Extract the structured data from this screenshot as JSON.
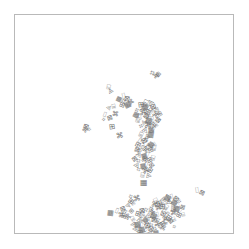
{
  "figure": {
    "background_color": "#ffffff",
    "frame_color": "#b9b9b9",
    "marker_color": "#737373",
    "frame": {
      "x": 14,
      "y": 14,
      "width": 220,
      "height": 220
    }
  },
  "chart_data": {
    "type": "scatter",
    "title": "",
    "subtitle": "",
    "xlabel": "",
    "ylabel": "",
    "xlim": [
      0,
      220
    ],
    "ylim": [
      0,
      220
    ],
    "grid": false,
    "legend": null,
    "axis_ticks": {
      "x": [],
      "y": []
    },
    "marker_style": "text-glyph",
    "clusters": [
      {
        "name": "upper-left-sparse",
        "approx_center_px": [
          110,
          100
        ],
        "count": 14
      },
      {
        "name": "upper-middle-chain",
        "approx_center_px": [
          140,
          120
        ],
        "count": 48
      },
      {
        "name": "mid-descending-tail",
        "approx_center_px": [
          136,
          150
        ],
        "count": 22
      },
      {
        "name": "lower-main-blob",
        "approx_center_px": [
          138,
          205
        ],
        "count": 72
      },
      {
        "name": "lower-right-arc",
        "approx_center_px": [
          158,
          196
        ],
        "count": 30
      },
      {
        "name": "outliers",
        "approx_center_px": [
          0,
          0
        ],
        "count": 6
      }
    ],
    "points": [
      [
        139,
        58,
        4.4,
        16
      ],
      [
        141,
        61,
        3.3,
        -22
      ],
      [
        144,
        59,
        3.0,
        40
      ],
      [
        95,
        72,
        3.6,
        12
      ],
      [
        96,
        76,
        3.1,
        -30
      ],
      [
        104,
        84,
        3.2,
        25
      ],
      [
        110,
        81,
        4.0,
        -14
      ],
      [
        113,
        84,
        3.6,
        8
      ],
      [
        110,
        86,
        4.2,
        34
      ],
      [
        116,
        87,
        3.2,
        -40
      ],
      [
        107,
        90,
        3.4,
        18
      ],
      [
        100,
        92,
        3.4,
        -10
      ],
      [
        95,
        92,
        3.0,
        44
      ],
      [
        113,
        90,
        3.8,
        -26
      ],
      [
        92,
        100,
        3.6,
        20
      ],
      [
        95,
        103,
        3.4,
        -18
      ],
      [
        90,
        104,
        3.0,
        36
      ],
      [
        100,
        99,
        3.4,
        6
      ],
      [
        127,
        90,
        3.8,
        -8
      ],
      [
        132,
        88,
        4.2,
        28
      ],
      [
        136,
        88,
        3.6,
        -34
      ],
      [
        130,
        92,
        4.0,
        14
      ],
      [
        135,
        93,
        3.4,
        42
      ],
      [
        139,
        92,
        3.8,
        -20
      ],
      [
        124,
        95,
        3.6,
        30
      ],
      [
        128,
        97,
        4.2,
        -12
      ],
      [
        133,
        97,
        3.4,
        22
      ],
      [
        138,
        96,
        3.8,
        -38
      ],
      [
        142,
        95,
        3.2,
        10
      ],
      [
        122,
        100,
        3.6,
        26
      ],
      [
        126,
        102,
        4.0,
        -16
      ],
      [
        131,
        101,
        3.4,
        38
      ],
      [
        136,
        101,
        3.8,
        -6
      ],
      [
        141,
        100,
        3.6,
        32
      ],
      [
        145,
        99,
        3.2,
        -28
      ],
      [
        124,
        106,
        3.8,
        12
      ],
      [
        129,
        107,
        3.4,
        -42
      ],
      [
        134,
        106,
        4.0,
        20
      ],
      [
        139,
        105,
        3.6,
        -14
      ],
      [
        143,
        105,
        3.4,
        36
      ],
      [
        128,
        111,
        3.6,
        -24
      ],
      [
        133,
        111,
        4.0,
        8
      ],
      [
        138,
        110,
        3.4,
        40
      ],
      [
        142,
        110,
        3.6,
        -32
      ],
      [
        131,
        115,
        3.8,
        18
      ],
      [
        136,
        115,
        3.4,
        -10
      ],
      [
        140,
        114,
        3.8,
        28
      ],
      [
        72,
        112,
        3.6,
        16
      ],
      [
        76,
        114,
        3.2,
        -36
      ],
      [
        70,
        115,
        3.0,
        44
      ],
      [
        98,
        112,
        3.8,
        -8
      ],
      [
        128,
        120,
        3.6,
        24
      ],
      [
        132,
        121,
        3.4,
        -18
      ],
      [
        136,
        120,
        3.8,
        10
      ],
      [
        126,
        125,
        3.4,
        34
      ],
      [
        130,
        126,
        3.8,
        -26
      ],
      [
        134,
        125,
        3.6,
        14
      ],
      [
        105,
        121,
        3.8,
        -12
      ],
      [
        124,
        130,
        3.6,
        28
      ],
      [
        129,
        131,
        4.0,
        -20
      ],
      [
        133,
        130,
        3.4,
        6
      ],
      [
        137,
        130,
        3.6,
        36
      ],
      [
        141,
        129,
        3.2,
        -30
      ],
      [
        122,
        135,
        3.4,
        18
      ],
      [
        127,
        136,
        3.8,
        -8
      ],
      [
        131,
        135,
        3.6,
        40
      ],
      [
        136,
        135,
        3.4,
        -22
      ],
      [
        140,
        134,
        3.8,
        12
      ],
      [
        125,
        140,
        3.6,
        30
      ],
      [
        129,
        141,
        3.4,
        -14
      ],
      [
        134,
        140,
        3.8,
        26
      ],
      [
        120,
        144,
        3.4,
        -36
      ],
      [
        125,
        146,
        3.8,
        8
      ],
      [
        130,
        145,
        3.6,
        20
      ],
      [
        135,
        145,
        3.4,
        -28
      ],
      [
        139,
        144,
        3.8,
        14
      ],
      [
        123,
        150,
        3.6,
        32
      ],
      [
        128,
        151,
        3.4,
        -10
      ],
      [
        133,
        150,
        3.8,
        22
      ],
      [
        137,
        150,
        3.4,
        -40
      ],
      [
        126,
        155,
        3.6,
        16
      ],
      [
        131,
        156,
        3.8,
        -24
      ],
      [
        135,
        155,
        3.4,
        34
      ],
      [
        129,
        160,
        3.6,
        10
      ],
      [
        133,
        160,
        3.4,
        -18
      ],
      [
        129,
        168,
        4.0,
        0
      ],
      [
        184,
        176,
        4.0,
        -8
      ],
      [
        187,
        178,
        3.4,
        26
      ],
      [
        118,
        182,
        3.6,
        20
      ],
      [
        122,
        184,
        3.8,
        -14
      ],
      [
        116,
        186,
        3.4,
        38
      ],
      [
        120,
        188,
        3.6,
        -30
      ],
      [
        113,
        190,
        3.2,
        12
      ],
      [
        96,
        198,
        3.6,
        8
      ],
      [
        104,
        196,
        3.6,
        24
      ],
      [
        108,
        194,
        3.4,
        -18
      ],
      [
        112,
        197,
        3.8,
        34
      ],
      [
        106,
        200,
        3.4,
        -8
      ],
      [
        110,
        201,
        3.6,
        14
      ],
      [
        143,
        186,
        3.8,
        -26
      ],
      [
        148,
        184,
        3.4,
        18
      ],
      [
        153,
        183,
        3.8,
        30
      ],
      [
        158,
        182,
        3.4,
        -12
      ],
      [
        162,
        184,
        3.6,
        40
      ],
      [
        166,
        186,
        3.2,
        -34
      ],
      [
        140,
        190,
        3.6,
        10
      ],
      [
        145,
        189,
        4.0,
        -20
      ],
      [
        150,
        188,
        3.4,
        28
      ],
      [
        155,
        187,
        3.8,
        -6
      ],
      [
        160,
        188,
        3.6,
        36
      ],
      [
        164,
        190,
        3.4,
        -24
      ],
      [
        168,
        192,
        3.2,
        16
      ],
      [
        138,
        194,
        3.8,
        22
      ],
      [
        143,
        193,
        3.4,
        -16
      ],
      [
        148,
        192,
        3.8,
        8
      ],
      [
        153,
        192,
        3.6,
        32
      ],
      [
        158,
        193,
        3.4,
        -28
      ],
      [
        162,
        194,
        3.8,
        12
      ],
      [
        166,
        196,
        3.4,
        38
      ],
      [
        128,
        196,
        3.6,
        -10
      ],
      [
        133,
        195,
        3.8,
        26
      ],
      [
        137,
        197,
        3.4,
        -34
      ],
      [
        124,
        199,
        3.6,
        18
      ],
      [
        129,
        200,
        4.0,
        -22
      ],
      [
        134,
        200,
        3.6,
        6
      ],
      [
        139,
        201,
        3.8,
        30
      ],
      [
        144,
        200,
        3.4,
        -14
      ],
      [
        149,
        199,
        3.8,
        20
      ],
      [
        154,
        198,
        3.4,
        36
      ],
      [
        159,
        198,
        3.6,
        -8
      ],
      [
        164,
        200,
        3.4,
        24
      ],
      [
        120,
        204,
        3.6,
        -30
      ],
      [
        125,
        205,
        3.8,
        14
      ],
      [
        130,
        205,
        3.4,
        40
      ],
      [
        135,
        206,
        4.0,
        -18
      ],
      [
        140,
        205,
        3.6,
        10
      ],
      [
        145,
        205,
        3.8,
        28
      ],
      [
        150,
        204,
        3.4,
        -12
      ],
      [
        155,
        203,
        3.6,
        34
      ],
      [
        160,
        204,
        3.2,
        -26
      ],
      [
        118,
        209,
        3.4,
        20
      ],
      [
        123,
        210,
        3.8,
        -6
      ],
      [
        128,
        210,
        3.6,
        32
      ],
      [
        133,
        211,
        4.0,
        -20
      ],
      [
        138,
        210,
        3.6,
        8
      ],
      [
        143,
        210,
        3.8,
        24
      ],
      [
        148,
        209,
        3.4,
        -36
      ],
      [
        153,
        208,
        3.6,
        16
      ],
      [
        122,
        214,
        3.6,
        28
      ],
      [
        127,
        215,
        3.8,
        -14
      ],
      [
        132,
        215,
        3.4,
        38
      ],
      [
        137,
        214,
        3.6,
        6
      ],
      [
        142,
        214,
        3.8,
        -28
      ],
      [
        147,
        213,
        3.4,
        22
      ],
      [
        126,
        218,
        3.6,
        12
      ],
      [
        131,
        219,
        3.4,
        -24
      ],
      [
        136,
        218,
        3.8,
        34
      ],
      [
        141,
        218,
        3.4,
        -10
      ],
      [
        150,
        196,
        3.2,
        44
      ],
      [
        156,
        206,
        3.2,
        -42
      ],
      [
        161,
        212,
        3.0,
        18
      ],
      [
        113,
        202,
        3.2,
        -38
      ],
      [
        117,
        196,
        3.0,
        42
      ],
      [
        169,
        200,
        3.0,
        -16
      ]
    ]
  }
}
